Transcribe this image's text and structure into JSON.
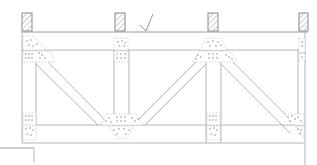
{
  "drawing": {
    "title": "Truss elevation sketch",
    "type": "truss-elevation",
    "panels": 2,
    "supports": [
      "post-1",
      "post-2",
      "post-3",
      "post-4"
    ],
    "annotation": "checkmark",
    "colors": {
      "line": "#b5b5b5",
      "hatch": "#8a8a8a",
      "fastener": "#777777",
      "background": "#ffffff"
    }
  }
}
